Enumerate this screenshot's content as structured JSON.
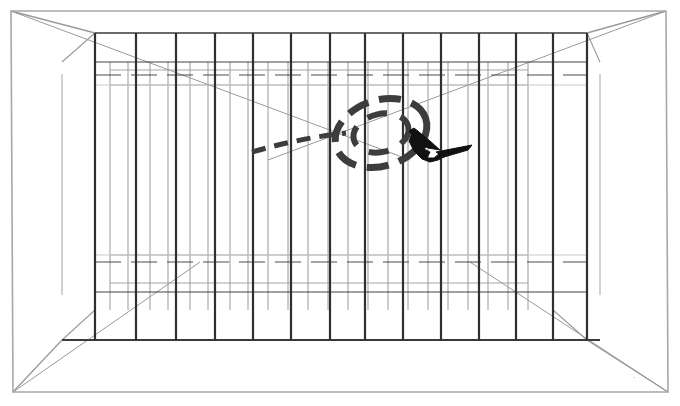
{
  "scene": {
    "title": "Bird in cage perspective line drawing",
    "type": "line-art-illustration",
    "canvas": {
      "width": 680,
      "height": 406
    },
    "colors": {
      "background": "#ffffff",
      "outer_frame": "#a8a8a8",
      "perspective_diagonal": "#9a9a9a",
      "near_bar": "#2f2f2f",
      "far_bar": "#8e8e8e",
      "near_rail": "#2f2f2f",
      "far_rail": "#9b9b9b",
      "floor_line": "#3a3a3a",
      "flight_path": "#3d3d3d",
      "bird": "#111111"
    }
  },
  "outer_frame": {
    "name": "picture-border",
    "points": "11,11 666,11 668,392 13,392",
    "stroke_width": 1.6
  },
  "perspective": {
    "vanishing_diagonals": [
      {
        "from": [
          11,
          11
        ],
        "to": [
          95,
          33
        ],
        "name": "top-left-diagonal"
      },
      {
        "from": [
          666,
          11
        ],
        "to": [
          587,
          33
        ],
        "name": "top-right-diagonal"
      },
      {
        "from": [
          13,
          392
        ],
        "to": [
          62,
          340
        ],
        "name": "bottom-left-diagonal"
      },
      {
        "from": [
          668,
          392
        ],
        "to": [
          587,
          340
        ],
        "name": "bottom-right-diagonal"
      }
    ],
    "inner_box": {
      "left": 62,
      "right": 600,
      "top": 33,
      "bottom": 340
    }
  },
  "cage": {
    "near_wall": {
      "top_y": 33,
      "bottom_y": 340,
      "bar_x": [
        95,
        136,
        176,
        215,
        253,
        291,
        330,
        365,
        403,
        441,
        479,
        516,
        553,
        587
      ],
      "bar_width": 2.2
    },
    "far_wall": {
      "top_y": 62,
      "bottom_y": 310,
      "bar_x": [
        110,
        128,
        150,
        168,
        190,
        208,
        230,
        248,
        268,
        288,
        308,
        328,
        348,
        368,
        388,
        408,
        428,
        448,
        468,
        488,
        508,
        528
      ],
      "bar_width": 0.9
    },
    "near_rails_y": [
      62,
      75,
      262,
      292
    ],
    "far_rails_y": [
      70,
      85,
      255,
      283
    ],
    "floor_line_y": 340,
    "ceiling_line_y": 33
  },
  "flight_path": {
    "name": "bird-flight-trajectory",
    "style": "dashed",
    "stroke_width": 7,
    "dash_pattern": "22 11",
    "loop": {
      "center": [
        381,
        133
      ],
      "rx": 47,
      "ry": 33,
      "rotation_deg": -18
    },
    "inner_loop": {
      "center": [
        381,
        133
      ],
      "rx": 28,
      "ry": 19,
      "rotation_deg": -14
    },
    "approach_curve": "M 252,152 Q 300,138 346,133",
    "approach_dash": "14 9",
    "approach_width": 5
  },
  "bird": {
    "name": "flying-bird-silhouette",
    "position": [
      432,
      148
    ],
    "heading": "right",
    "body_path": "M 418,131 L 426,139 L 430,144 L 424,149 L 430,152 L 427,158 L 434,158 L 440,153 L 449,150 L 470,146 L 462,150 L 448,155 L 438,160 L 430,162 L 422,159 L 414,151 L 409,141 L 412,133 Z",
    "wing_upper_path": "M 414,128 L 430,141 L 440,150 L 428,148 L 415,139 L 409,131 Z",
    "tail_path": "M 436,152 L 472,145 L 468,150 L 444,157 Z"
  },
  "annotations": {
    "signature_mark": {
      "x": 633,
      "y": 378,
      "text": "."
    }
  }
}
